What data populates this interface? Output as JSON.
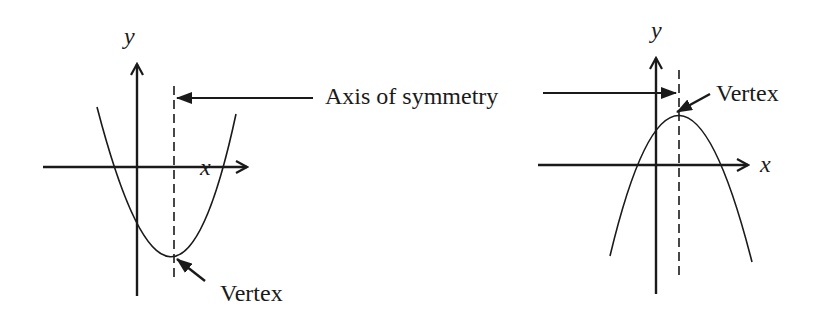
{
  "labels": {
    "axis_of_symmetry": "Axis of symmetry",
    "left_vertex": "Vertex",
    "right_vertex": "Vertex",
    "left_y_axis": "y",
    "left_x_axis": "x",
    "right_y_axis": "y",
    "right_x_axis": "x"
  },
  "graphs": [
    {
      "name": "upward-parabola",
      "opens": "up",
      "vertex_position": "below x-axis, right of y-axis"
    },
    {
      "name": "downward-parabola",
      "opens": "down",
      "vertex_position": "above x-axis, right of y-axis"
    }
  ],
  "colors": {
    "stroke": "#1a1a1a",
    "background": "#ffffff"
  }
}
